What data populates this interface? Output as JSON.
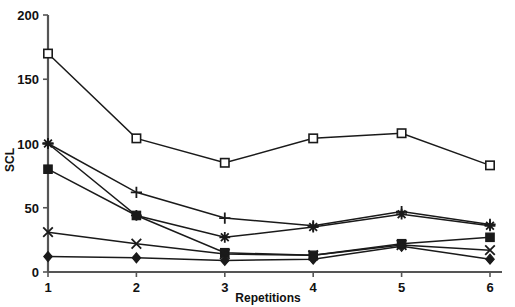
{
  "chart_data": {
    "type": "line",
    "title": "",
    "subtitle": "",
    "xlabel": "Repetitions",
    "ylabel": "SCL",
    "x": [
      1,
      2,
      3,
      4,
      5,
      6
    ],
    "categories": [
      "1",
      "2",
      "3",
      "4",
      "5",
      "6"
    ],
    "xtick_labels": [
      "1",
      "2",
      "3",
      "4",
      "5",
      "6"
    ],
    "ytick_labels": [
      "0",
      "50",
      "100",
      "150",
      "200"
    ],
    "ytick_values": [
      0,
      50,
      100,
      150,
      200
    ],
    "xlim": [
      1,
      6
    ],
    "ylim": [
      0,
      200
    ],
    "grid": false,
    "legend": "none",
    "series": [
      {
        "name": "open-square",
        "marker": "open-square",
        "values": [
          170,
          104,
          85,
          104,
          108,
          83
        ]
      },
      {
        "name": "plus",
        "marker": "plus",
        "values": [
          100,
          62,
          42,
          36,
          47,
          37
        ]
      },
      {
        "name": "asterisk",
        "marker": "asterisk",
        "values": [
          100,
          44,
          27,
          35,
          45,
          36
        ]
      },
      {
        "name": "filled-square",
        "marker": "filled-square",
        "values": [
          80,
          44,
          15,
          13,
          22,
          27
        ]
      },
      {
        "name": "cross",
        "marker": "cross",
        "values": [
          31,
          22,
          14,
          13,
          21,
          17
        ]
      },
      {
        "name": "filled-diamond",
        "marker": "filled-diamond",
        "values": [
          12,
          11,
          9,
          10,
          20,
          10
        ]
      }
    ],
    "colors": {
      "line": "#1a1a1a",
      "axis": "#555555",
      "text": "#111111",
      "background": "#ffffff"
    }
  }
}
